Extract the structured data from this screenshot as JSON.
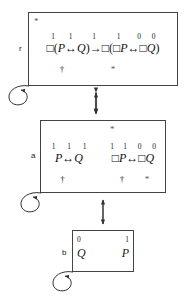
{
  "diagram": {
    "worlds": [
      {
        "id": "r",
        "label": "r",
        "top_marker": "*",
        "valuation_digits": [
          "1",
          "1",
          "1",
          "1",
          "0",
          "0"
        ],
        "formula": "□(P↔Q)→□(□P↔□Q)",
        "formula_parts": {
          "box1": "□",
          "lparen1": "(",
          "p1": "P",
          "biconditional1": "↔",
          "q1": "Q",
          "rparen1": ")",
          "implication": "→",
          "box2": "□",
          "lparen2": "(",
          "box3": "□",
          "p2": "P",
          "biconditional2": "↔",
          "box4": "□",
          "q2": "Q",
          "rparen2": ")"
        },
        "markers_below": {
          "dagger": "†",
          "asterisk": "*"
        }
      },
      {
        "id": "a",
        "label": "a",
        "top_marker": "*",
        "left_formula": {
          "valuation_digits": [
            "1",
            "1",
            "1"
          ],
          "formula": "P↔Q",
          "parts": {
            "p": "P",
            "biconditional": "↔",
            "q": "Q"
          },
          "markers_below": {
            "dagger": "†"
          }
        },
        "right_formula": {
          "valuation_digits": [
            "1",
            "1",
            "0",
            "0"
          ],
          "formula": "□P↔□Q",
          "parts": {
            "box1": "□",
            "p": "P",
            "biconditional": "↔",
            "box2": "□",
            "q": "Q"
          },
          "markers_below": {
            "dagger": "†",
            "asterisk": "*"
          }
        }
      },
      {
        "id": "b",
        "label": "b",
        "valuation_digits": [
          "0",
          "1"
        ],
        "atoms": [
          "Q",
          "P"
        ]
      }
    ],
    "edges": [
      {
        "from": "r",
        "to": "a",
        "style": "double-headed-vertical-arrow"
      },
      {
        "from": "a",
        "to": "b",
        "style": "double-headed-vertical-arrow"
      },
      {
        "from": "r",
        "to": "r",
        "style": "self-loop"
      },
      {
        "from": "a",
        "to": "a",
        "style": "self-loop"
      },
      {
        "from": "b",
        "to": "b",
        "style": "self-loop"
      }
    ],
    "colors": {
      "stroke": "#444444",
      "text": "#1a1a1a",
      "marker": "#555555",
      "background": "#ffffff"
    }
  }
}
